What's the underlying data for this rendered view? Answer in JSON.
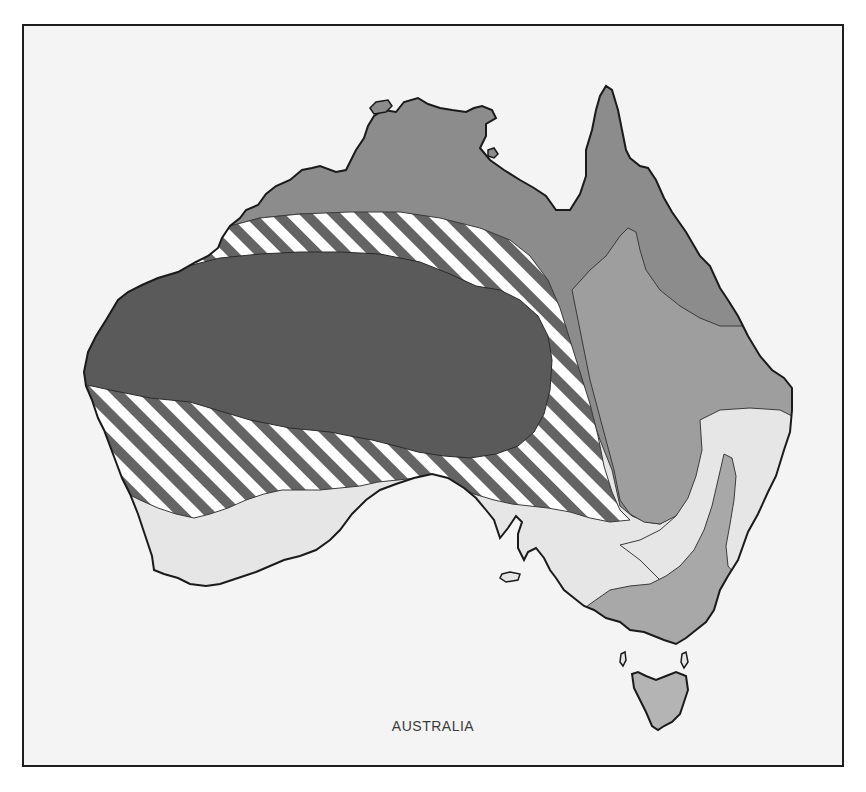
{
  "map": {
    "title": "AUSTRALIA",
    "colors": {
      "background": "#f4f4f4",
      "frame": "#1e1e1e",
      "coastline": "#1a1a1a",
      "zone_boundary": "#3a3a3a",
      "zone_darkest_interior": "#5a5a5a",
      "zone_striped_dark": "#646464",
      "zone_striped_light": "#ffffff",
      "zone_north_dark_grey": "#8c8c8c",
      "zone_east_mid_grey": "#9e9e9e",
      "zone_southeast_mid_grey": "#a8a8a8",
      "zone_light_grey": "#e6e6e6",
      "tasmania": "#b4b4b4"
    },
    "zones": [
      {
        "id": "interior",
        "fill": "darkest solid grey",
        "region": "central and western interior"
      },
      {
        "id": "transition",
        "fill": "diagonal stripes",
        "region": "band surrounding interior"
      },
      {
        "id": "north",
        "fill": "dark grey",
        "region": "northern coast and Cape York"
      },
      {
        "id": "east",
        "fill": "mid grey",
        "region": "eastern Queensland / NSW inland"
      },
      {
        "id": "south-light",
        "fill": "light grey",
        "region": "southwest WA, southern SA, eastern coast"
      },
      {
        "id": "southeast",
        "fill": "mid grey",
        "region": "Victoria, southern NSW highlands"
      },
      {
        "id": "tasmania",
        "fill": "mid-light grey",
        "region": "Tasmania"
      }
    ]
  }
}
